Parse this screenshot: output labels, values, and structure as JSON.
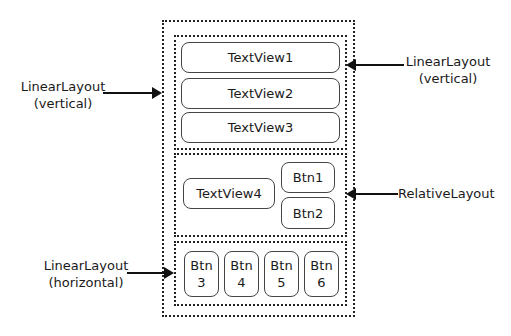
{
  "diagram": {
    "containers": {
      "outer": {
        "type": "LinearLayout",
        "orientation": "vertical"
      },
      "top": {
        "type": "LinearLayout",
        "orientation": "vertical"
      },
      "middle": {
        "type": "RelativeLayout"
      },
      "bottom": {
        "type": "LinearLayout",
        "orientation": "horizontal"
      }
    },
    "top_items": [
      "TextView1",
      "TextView2",
      "TextView3"
    ],
    "middle_items": {
      "textview": "TextView4",
      "btn1": "Btn1",
      "btn2": "Btn2"
    },
    "bottom_items": [
      {
        "line1": "Btn",
        "line2": "3"
      },
      {
        "line1": "Btn",
        "line2": "4"
      },
      {
        "line1": "Btn",
        "line2": "5"
      },
      {
        "line1": "Btn",
        "line2": "6"
      }
    ],
    "callouts": {
      "outer_left": {
        "line1": "LinearLayout",
        "line2": "(vertical)"
      },
      "top_right": {
        "line1": "LinearLayout",
        "line2": "(vertical)"
      },
      "middle_right": {
        "line1": "RelativeLayout"
      },
      "bottom_left": {
        "line1": "LinearLayout",
        "line2": "(horizontal)"
      }
    }
  }
}
